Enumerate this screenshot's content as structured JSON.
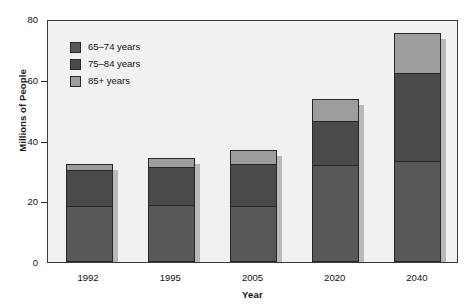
{
  "chart_data": {
    "type": "bar",
    "subtype": "stacked-bar",
    "title": "",
    "xlabel": "Year",
    "ylabel": "Millions of People",
    "categories": [
      "1992",
      "1995",
      "2005",
      "2020",
      "2040"
    ],
    "ylim": [
      0,
      80
    ],
    "yticks": [
      0,
      20,
      40,
      60,
      80
    ],
    "ytick_labels": [
      "0",
      "20",
      "40",
      "60",
      "80"
    ],
    "grid": false,
    "legend_position": "upper-left-inside",
    "series": [
      {
        "name": "65–74 years",
        "color": "#585858",
        "values": [
          18,
          18.5,
          18,
          31.5,
          33
        ]
      },
      {
        "name": "75–84 years",
        "color": "#4a4a4a",
        "values": [
          12,
          12.5,
          14,
          14.5,
          29
        ]
      },
      {
        "name": "85+ years",
        "color": "#9d9d9d",
        "values": [
          2,
          3,
          4.5,
          7.5,
          13
        ]
      }
    ],
    "totals": [
      32,
      34,
      36.5,
      53.5,
      75
    ]
  },
  "legend": {
    "items": [
      {
        "label": "65–74 years",
        "color": "#585858"
      },
      {
        "label": "75–84 years",
        "color": "#4a4a4a"
      },
      {
        "label": "85+ years",
        "color": "#9d9d9d"
      }
    ]
  },
  "axes": {
    "y_title": "Millions of People",
    "x_title": "Year"
  },
  "colors": {
    "plot_background": "#f1f1f1",
    "frame": "#3a3a3a",
    "bar_outline": "#262626",
    "shadow": "#b9b9b9",
    "text": "#111111"
  }
}
